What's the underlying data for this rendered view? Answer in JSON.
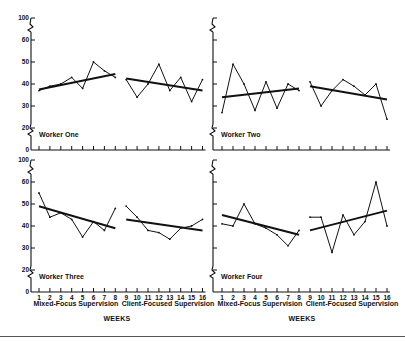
{
  "chart_data": {
    "type": "line",
    "title": "",
    "xlabel": "WEEKS",
    "ylabel": "",
    "ylim": [
      0,
      100
    ],
    "y_ticks": [
      0,
      20,
      30,
      40,
      50,
      60,
      100
    ],
    "y_axis_break": "broken between 0-20 and 60-100",
    "x": [
      1,
      2,
      3,
      4,
      5,
      6,
      7,
      8,
      9,
      10,
      11,
      12,
      13,
      14,
      15,
      16
    ],
    "phases": [
      {
        "label": "Mixed-Focus Supervision",
        "weeks": [
          1,
          8
        ]
      },
      {
        "label": "Client-Focused Supervision",
        "weeks": [
          9,
          16
        ]
      }
    ],
    "grid": false,
    "legend": "none",
    "panels": [
      {
        "name": "Worker One",
        "position": "top-left",
        "values": [
          37,
          39,
          40,
          43,
          38,
          50,
          46,
          43,
          42,
          34,
          40,
          49,
          37,
          43,
          32,
          42
        ],
        "trend": [
          {
            "phase": "Mixed-Focus Supervision",
            "start": [
              1,
              37.5
            ],
            "end": [
              8,
              44.5
            ]
          },
          {
            "phase": "Client-Focused Supervision",
            "start": [
              9,
              42.5
            ],
            "end": [
              16,
              37
            ]
          }
        ]
      },
      {
        "name": "Worker Two",
        "position": "top-right",
        "values": [
          27,
          49,
          40,
          28,
          41,
          29,
          40,
          37,
          41,
          30,
          37,
          42,
          39,
          35,
          40,
          24
        ],
        "trend": [
          {
            "phase": "Mixed-Focus Supervision",
            "start": [
              1,
              34
            ],
            "end": [
              8,
              38
            ]
          },
          {
            "phase": "Client-Focused Supervision",
            "start": [
              9,
              39
            ],
            "end": [
              16,
              33
            ]
          }
        ]
      },
      {
        "name": "Worker Three",
        "position": "bottom-left",
        "values": [
          55,
          44,
          46,
          43,
          35,
          42,
          38,
          48,
          49,
          44,
          38,
          37,
          34,
          39,
          40,
          43
        ],
        "trend": [
          {
            "phase": "Mixed-Focus Supervision",
            "start": [
              1,
              49
            ],
            "end": [
              8,
              39
            ]
          },
          {
            "phase": "Client-Focused Supervision",
            "start": [
              9,
              43
            ],
            "end": [
              16,
              38
            ]
          }
        ]
      },
      {
        "name": "Worker Four",
        "position": "bottom-right",
        "values": [
          41,
          40,
          50,
          41,
          39,
          36,
          31,
          38,
          44,
          44,
          28,
          45,
          36,
          42,
          60,
          40
        ],
        "trend": [
          {
            "phase": "Mixed-Focus Supervision",
            "start": [
              1,
              45
            ],
            "end": [
              8,
              36
            ]
          },
          {
            "phase": "Client-Focused Supervision",
            "start": [
              9,
              38
            ],
            "end": [
              16,
              47
            ]
          }
        ]
      }
    ]
  },
  "labels": {
    "phase_left": "Mixed-Focus Supervision",
    "phase_right": "Client-Focused Supervision",
    "weeks_left": "WEEKS",
    "weeks_right": "WEEKS",
    "worker_one": "Worker One",
    "worker_two": "Worker Two",
    "worker_three": "Worker Three",
    "worker_four": "Worker Four"
  }
}
